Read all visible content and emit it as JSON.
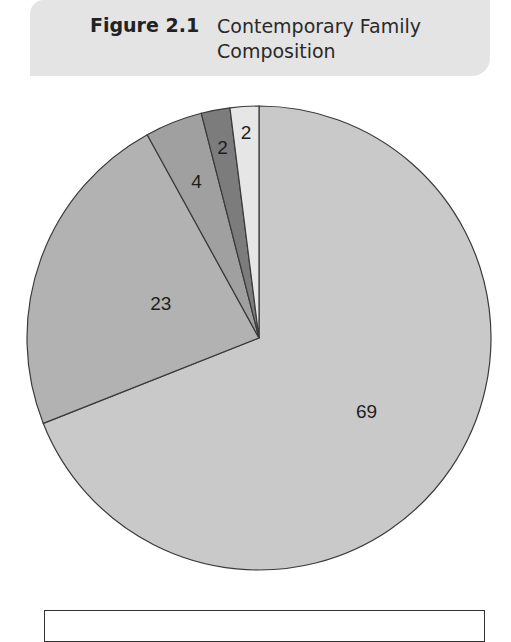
{
  "figure": {
    "label": "Figure 2.1",
    "title": "Contemporary Family Composition"
  },
  "chart_data": {
    "type": "pie",
    "title": "Contemporary Family Composition",
    "start_angle": "12 o'clock, clockwise",
    "slices": [
      {
        "value": 69,
        "label": "69",
        "color": "#c9c9c9"
      },
      {
        "value": 23,
        "label": "23",
        "color": "#b2b2b2"
      },
      {
        "value": 4,
        "label": "4",
        "color": "#a0a0a0"
      },
      {
        "value": 2,
        "label": "2",
        "color": "#7c7c7c"
      },
      {
        "value": 2,
        "label": "2",
        "color": "#e6e6e6"
      }
    ],
    "values": [
      69,
      23,
      4,
      2,
      2
    ],
    "legend": "box below chart (contents cut off)"
  }
}
